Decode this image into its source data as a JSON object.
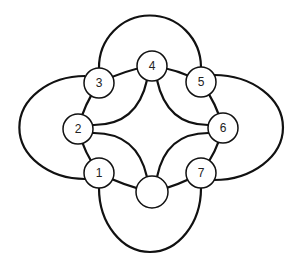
{
  "diagram": {
    "title": "",
    "colors": {
      "stroke": "#111111",
      "node_fill": "#ffffff",
      "label": "#222222"
    },
    "nodes": [
      {
        "id": "1",
        "label": "1",
        "x": 99,
        "y": 173,
        "r": 15
      },
      {
        "id": "2",
        "label": "2",
        "x": 78,
        "y": 129,
        "r": 15
      },
      {
        "id": "3",
        "label": "3",
        "x": 99,
        "y": 83,
        "r": 15
      },
      {
        "id": "4",
        "label": "4",
        "x": 152,
        "y": 66,
        "r": 15
      },
      {
        "id": "5",
        "label": "5",
        "x": 201,
        "y": 82,
        "r": 15
      },
      {
        "id": "6",
        "label": "6",
        "x": 223,
        "y": 128,
        "r": 15
      },
      {
        "id": "7",
        "label": "7",
        "x": 201,
        "y": 173,
        "r": 15
      },
      {
        "id": "8",
        "label": "",
        "x": 152,
        "y": 192,
        "r": 16
      }
    ],
    "edges": [
      {
        "from": "1",
        "to": "2",
        "type": "ring"
      },
      {
        "from": "2",
        "to": "3",
        "type": "ring"
      },
      {
        "from": "3",
        "to": "4",
        "type": "ring"
      },
      {
        "from": "4",
        "to": "5",
        "type": "ring"
      },
      {
        "from": "5",
        "to": "6",
        "type": "ring"
      },
      {
        "from": "6",
        "to": "7",
        "type": "ring"
      },
      {
        "from": "7",
        "to": "8",
        "type": "ring"
      },
      {
        "from": "8",
        "to": "1",
        "type": "ring"
      },
      {
        "from": "4",
        "to": "2",
        "type": "inner-arc"
      },
      {
        "from": "4",
        "to": "6",
        "type": "inner-arc"
      },
      {
        "from": "2",
        "to": "8",
        "type": "inner-arc"
      },
      {
        "from": "6",
        "to": "8",
        "type": "inner-arc"
      },
      {
        "from": "3",
        "to": "5",
        "type": "outer-arc-top"
      },
      {
        "from": "5",
        "to": "7",
        "type": "outer-arc-right"
      },
      {
        "from": "7",
        "to": "1",
        "type": "outer-arc-bottom"
      },
      {
        "from": "1",
        "to": "3",
        "type": "outer-arc-left"
      }
    ]
  }
}
